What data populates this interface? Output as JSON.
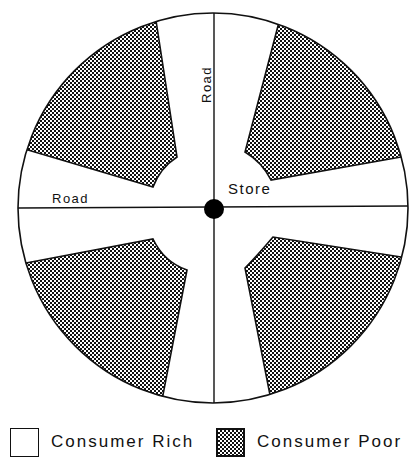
{
  "diagram": {
    "labels": {
      "road_vertical": "Road",
      "road_horizontal": "Road",
      "store": "Store"
    },
    "colors": {
      "ink": "#111111",
      "background": "#ffffff"
    },
    "regions": [
      {
        "quadrant": "top-left",
        "type": "Consumer Poor"
      },
      {
        "quadrant": "top-right",
        "type": "Consumer Poor"
      },
      {
        "quadrant": "bottom-left",
        "type": "Consumer Poor"
      },
      {
        "quadrant": "bottom-right",
        "type": "Consumer Poor"
      },
      {
        "quadrant": "center-cross",
        "type": "Consumer Rich"
      }
    ]
  },
  "legend": {
    "items": [
      {
        "label": "Consumer Rich",
        "pattern": "white"
      },
      {
        "label": "Consumer Poor",
        "pattern": "stipple"
      }
    ]
  }
}
